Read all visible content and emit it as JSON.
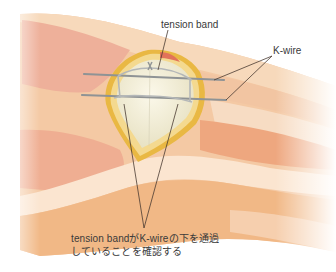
{
  "figure": {
    "labels": {
      "tension_band": "tension band",
      "k_wire": "K-wire"
    },
    "caption": {
      "line1": "tension bandがK-wireの下を通過",
      "line2": "していることを確認する"
    },
    "colors": {
      "skin_light": "#f6d7b8",
      "skin_mid": "#f0b98f",
      "skin_pink": "#eca88e",
      "skin_highlight": "#fbe9d8",
      "wound_rim": "#e9b843",
      "bone": "#f3efdc",
      "wire": "#9a9d9f",
      "leader_line": "#4a3b32",
      "text": "#3a3a3a"
    }
  }
}
